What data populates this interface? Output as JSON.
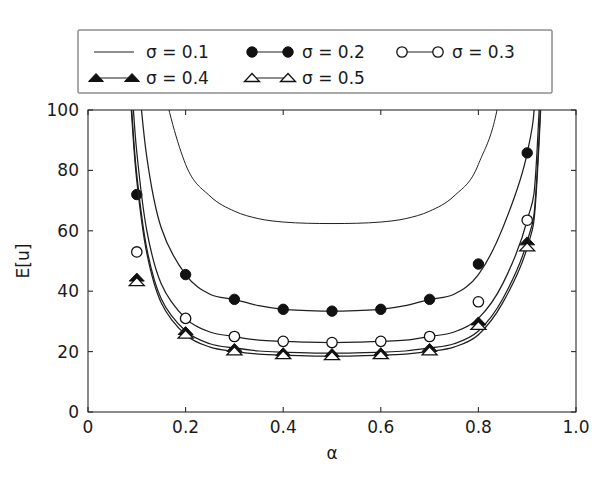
{
  "chart_data": {
    "type": "line",
    "title": "",
    "subtitle": "",
    "xlabel": "α",
    "ylabel": "E[u]",
    "xlim": [
      0.0,
      1.0
    ],
    "ylim": [
      0,
      100
    ],
    "xticks": [
      0,
      0.2,
      0.4,
      0.6,
      0.8,
      1.0
    ],
    "xticklabels": [
      "0",
      "0.2",
      "0.4",
      "0.6",
      "0.8",
      "1.0"
    ],
    "yticks": [
      0,
      20,
      40,
      60,
      80,
      100
    ],
    "yticklabels": [
      "0",
      "20",
      "40",
      "60",
      "80",
      "100"
    ],
    "grid": false,
    "legend_position": "above-axes",
    "legend_columns": 3,
    "x": [
      0.05,
      0.06,
      0.07,
      0.08,
      0.09,
      0.1,
      0.12,
      0.15,
      0.2,
      0.25,
      0.3,
      0.35,
      0.4,
      0.45,
      0.5,
      0.55,
      0.6,
      0.65,
      0.7,
      0.75,
      0.8,
      0.85,
      0.9,
      0.92,
      0.94,
      0.95
    ],
    "series": [
      {
        "name": "σ = 0.1",
        "sigma": 0.1,
        "marker": "none",
        "marker_fill": "none",
        "linestyle": "solid",
        "values": [
          690.0,
          520.0,
          400.0,
          315.0,
          252.0,
          206.0,
          152.0,
          112.0,
          82.0,
          71.5,
          66.5,
          64.0,
          62.9,
          62.5,
          62.4,
          62.5,
          62.9,
          64.0,
          66.5,
          71.5,
          82.0,
          112.0,
          206.0,
          315.0,
          520.0,
          690.0
        ],
        "marker_x": [],
        "marker_y": []
      },
      {
        "name": "σ = 0.2",
        "sigma": 0.2,
        "marker": "circle",
        "marker_fill": "filled",
        "linestyle": "solid",
        "values": [
          420.0,
          310.0,
          236.0,
          183.0,
          145.0,
          118.0,
          85.0,
          61.0,
          45.5,
          39.0,
          37.3,
          35.2,
          34.0,
          33.6,
          33.4,
          33.6,
          34.0,
          35.2,
          37.3,
          39.0,
          45.5,
          61.0,
          85.8,
          118.0,
          236.0,
          420.0
        ],
        "marker_x": [
          0.1,
          0.2,
          0.3,
          0.4,
          0.5,
          0.6,
          0.7,
          0.8,
          0.9
        ],
        "marker_y": [
          72.0,
          45.5,
          37.3,
          34.0,
          33.4,
          34.0,
          37.3,
          49.0,
          85.8
        ]
      },
      {
        "name": "σ = 0.3",
        "sigma": 0.3,
        "marker": "circle",
        "marker_fill": "open",
        "linestyle": "solid",
        "values": [
          330.0,
          240.0,
          180.0,
          138.0,
          108.0,
          86.0,
          60.5,
          42.5,
          31.0,
          26.5,
          25.0,
          23.8,
          23.4,
          23.1,
          23.0,
          23.1,
          23.4,
          23.8,
          25.0,
          26.5,
          31.0,
          42.5,
          63.5,
          86.0,
          180.0,
          330.0
        ],
        "marker_x": [
          0.1,
          0.2,
          0.3,
          0.4,
          0.5,
          0.6,
          0.7,
          0.8,
          0.9
        ],
        "marker_y": [
          53.0,
          31.0,
          25.0,
          23.4,
          23.0,
          23.4,
          25.0,
          36.5,
          63.5
        ]
      },
      {
        "name": "σ = 0.4",
        "sigma": 0.4,
        "marker": "triangle",
        "marker_fill": "filled",
        "linestyle": "solid",
        "values": [
          305.0,
          222.0,
          166.0,
          127.0,
          99.0,
          78.5,
          54.5,
          37.5,
          26.8,
          22.6,
          21.2,
          20.2,
          19.8,
          19.6,
          19.5,
          19.6,
          19.8,
          20.2,
          21.2,
          22.6,
          26.8,
          37.5,
          56.5,
          78.5,
          166.0,
          305.0
        ],
        "marker_x": [
          0.1,
          0.2,
          0.3,
          0.4,
          0.5,
          0.6,
          0.7,
          0.8,
          0.9
        ],
        "marker_y": [
          44.5,
          26.8,
          21.2,
          19.8,
          19.5,
          19.8,
          21.2,
          30.0,
          56.5
        ]
      },
      {
        "name": "σ = 0.5",
        "sigma": 0.5,
        "marker": "triangle",
        "marker_fill": "open",
        "linestyle": "solid",
        "values": [
          300.0,
          218.0,
          163.0,
          124.0,
          97.0,
          76.5,
          53.0,
          36.2,
          25.6,
          21.5,
          20.1,
          19.2,
          18.8,
          18.6,
          18.5,
          18.6,
          18.8,
          19.2,
          20.1,
          21.5,
          25.6,
          36.2,
          54.5,
          76.5,
          163.0,
          300.0
        ],
        "marker_x": [
          0.1,
          0.2,
          0.3,
          0.4,
          0.5,
          0.6,
          0.7,
          0.8,
          0.9
        ],
        "marker_y": [
          43.0,
          25.6,
          20.1,
          18.8,
          18.5,
          18.8,
          20.1,
          28.5,
          54.5
        ]
      }
    ]
  },
  "legend": {
    "entries": [
      {
        "label": "σ = 0.1",
        "marker": "none",
        "fill": "none"
      },
      {
        "label": "σ = 0.2",
        "marker": "circle",
        "fill": "filled"
      },
      {
        "label": "σ = 0.3",
        "marker": "circle",
        "fill": "open"
      },
      {
        "label": "σ = 0.4",
        "marker": "triangle",
        "fill": "filled"
      },
      {
        "label": "σ = 0.5",
        "marker": "triangle",
        "fill": "open"
      }
    ]
  },
  "colors": {
    "line": "#1f1f1f",
    "axis": "#2b2b2b",
    "text": "#1a1a1a",
    "background": "#ffffff",
    "legend_border": "#555555"
  }
}
